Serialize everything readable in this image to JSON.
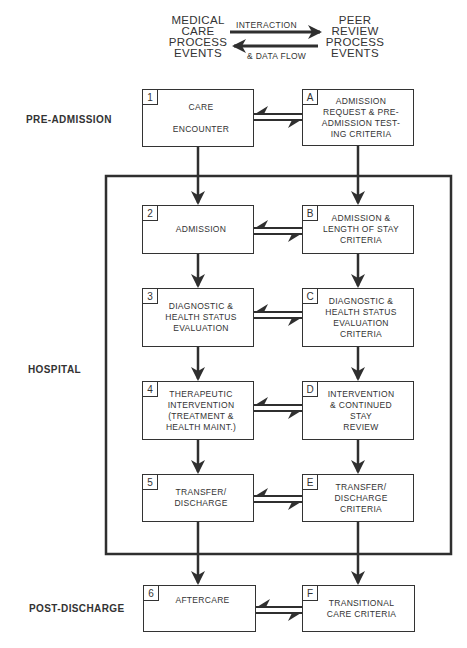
{
  "legend": {
    "left_label": "MEDICAL\nCARE\nPROCESS\nEVENTS",
    "right_label": "PEER\nREVIEW\nPROCESS\nEVENTS",
    "top_arrow_label": "INTERACTION",
    "bottom_arrow_label": "& DATA FLOW"
  },
  "phases": {
    "pre_admission": "PRE-ADMISSION",
    "hospital": "HOSPITAL",
    "post_discharge": "POST-DISCHARGE"
  },
  "medical_care_boxes": [
    {
      "id": "1",
      "text": "CARE\n\nENCOUNTER"
    },
    {
      "id": "2",
      "text": "ADMISSION"
    },
    {
      "id": "3",
      "text": "DIAGNOSTIC &\nHEALTH STATUS\nEVALUATION"
    },
    {
      "id": "4",
      "text": "THERAPEUTIC\nINTERVENTION\n(TREATMENT &\nHEALTH MAINT.)"
    },
    {
      "id": "5",
      "text": "TRANSFER/\nDISCHARGE"
    },
    {
      "id": "6",
      "text": "AFTERCARE"
    }
  ],
  "peer_review_boxes": [
    {
      "id": "A",
      "text": "ADMISSION\nREQUEST & PRE-\nADMISSION TEST-\nING CRITERIA"
    },
    {
      "id": "B",
      "text": "ADMISSION &\nLENGTH OF STAY\nCRITERIA"
    },
    {
      "id": "C",
      "text": "DIAGNOSTIC &\nHEALTH STATUS\nEVALUATION\nCRITERIA"
    },
    {
      "id": "D",
      "text": "INTERVENTION\n& CONTINUED\nSTAY\nREVIEW"
    },
    {
      "id": "E",
      "text": "TRANSFER/\nDISCHARGE\nCRITERIA"
    },
    {
      "id": "F",
      "text": "TRANSITIONAL\nCARE CRITERIA"
    }
  ],
  "colors": {
    "line": "#2f2f2f",
    "background": "#ffffff"
  }
}
